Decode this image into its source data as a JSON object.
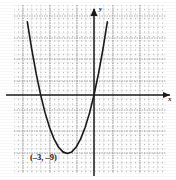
{
  "figure": {
    "kind": "cartesian-graph",
    "background": "#ffffff",
    "ink": "#1a1a1a",
    "grid_color": "#9a9a9a",
    "axis_color": "#1a1a1a",
    "curve_color": "#1a1a1a",
    "axis_labels": {
      "x": "x",
      "y": "y"
    },
    "annotations": [
      {
        "name": "vertex-label",
        "text": "(–3, –9)",
        "x": -3,
        "y": -9
      }
    ]
  },
  "chart_data": {
    "type": "line",
    "title": "",
    "xlabel": "x",
    "ylabel": "y",
    "grid": true,
    "legend": null,
    "xlim": [
      -9,
      8
    ],
    "ylim": [
      -12,
      12
    ],
    "xticks": [
      -9,
      -8,
      -7,
      -6,
      -5,
      -4,
      -3,
      -2,
      -1,
      0,
      1,
      2,
      3,
      4,
      5,
      6,
      7,
      8
    ],
    "yticks": [
      -12,
      -11,
      -10,
      -9,
      -8,
      -7,
      -6,
      -5,
      -4,
      -3,
      -2,
      -1,
      0,
      1,
      2,
      3,
      4,
      5,
      6,
      7,
      8,
      9,
      10,
      11,
      12
    ],
    "xtick_labels": [],
    "ytick_labels": [],
    "series": [
      {
        "name": "parabola",
        "equation": "y = x^2 + 6x",
        "vertex": [
          -3,
          -9
        ],
        "x_intercepts": [
          -6,
          0
        ],
        "y_intercept": 0,
        "opens": "up",
        "x": [
          -8.2,
          -8,
          -7.5,
          -7,
          -6.5,
          -6,
          -5.5,
          -5,
          -4.5,
          -4,
          -3.5,
          -3,
          -2.5,
          -2,
          -1.5,
          -1,
          -0.5,
          0,
          0.5,
          1,
          1.5,
          2
        ],
        "values": [
          17.96,
          16,
          11.25,
          7,
          3.25,
          0,
          -2.75,
          -5,
          -6.75,
          -8,
          -8.75,
          -9,
          -8.75,
          -8,
          -6.75,
          -5,
          -2.75,
          0,
          3.25,
          7,
          11.25,
          16
        ]
      }
    ]
  }
}
